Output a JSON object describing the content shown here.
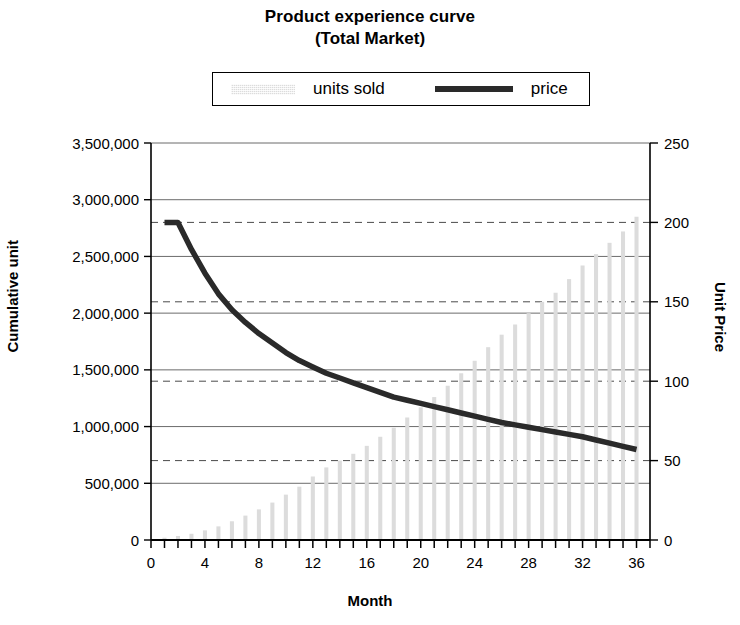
{
  "chart_data": {
    "type": "bar",
    "title": "Product experience curve",
    "subtitle": "(Total Market)",
    "xlabel": "Month",
    "ylabel": "Cumulative unit",
    "y2label": "Unit Price",
    "grid": true,
    "legend_position": "top",
    "xlim": [
      0,
      37
    ],
    "ylim": [
      0,
      3500000
    ],
    "y2lim": [
      0,
      250
    ],
    "x_tick_labels": [
      "0",
      "4",
      "8",
      "12",
      "16",
      "20",
      "24",
      "28",
      "32",
      "36"
    ],
    "x_tick_values": [
      0,
      4,
      8,
      12,
      16,
      20,
      24,
      28,
      32,
      36
    ],
    "x_minor_tick_step": 1,
    "y_tick_labels": [
      "0",
      "500,000",
      "1,000,000",
      "1,500,000",
      "2,000,000",
      "2,500,000",
      "3,000,000",
      "3,500,000"
    ],
    "y_tick_values": [
      0,
      500000,
      1000000,
      1500000,
      2000000,
      2500000,
      3000000,
      3500000
    ],
    "y2_tick_labels": [
      "0",
      "50",
      "100",
      "150",
      "200",
      "250"
    ],
    "y2_tick_values": [
      0,
      50,
      100,
      150,
      200,
      250
    ],
    "x": [
      1,
      2,
      3,
      4,
      5,
      6,
      7,
      8,
      9,
      10,
      11,
      12,
      13,
      14,
      15,
      16,
      17,
      18,
      19,
      20,
      21,
      22,
      23,
      24,
      25,
      26,
      27,
      28,
      29,
      30,
      31,
      32,
      33,
      34,
      35,
      36
    ],
    "series": [
      {
        "name": "units sold",
        "type": "bar",
        "axis": "left",
        "color": "#dcdcdc",
        "values": [
          20000,
          35000,
          55000,
          85000,
          120000,
          165000,
          215000,
          270000,
          330000,
          400000,
          470000,
          560000,
          640000,
          700000,
          760000,
          830000,
          910000,
          990000,
          1080000,
          1170000,
          1260000,
          1360000,
          1470000,
          1580000,
          1700000,
          1810000,
          1900000,
          2000000,
          2100000,
          2180000,
          2300000,
          2420000,
          2520000,
          2620000,
          2720000,
          2850000
        ]
      },
      {
        "name": "price",
        "type": "line",
        "axis": "right",
        "color": "#2a2a2a",
        "values": [
          200,
          200,
          183,
          168,
          155,
          145,
          137,
          130,
          124,
          118,
          113,
          109,
          105,
          102,
          99,
          96,
          93,
          90,
          88,
          86,
          84,
          82,
          80,
          78,
          76,
          74,
          72.5,
          71,
          69.5,
          68,
          66.5,
          65,
          63,
          61,
          59,
          57
        ]
      }
    ]
  },
  "legend": {
    "units_label": "units sold",
    "price_label": "price"
  }
}
